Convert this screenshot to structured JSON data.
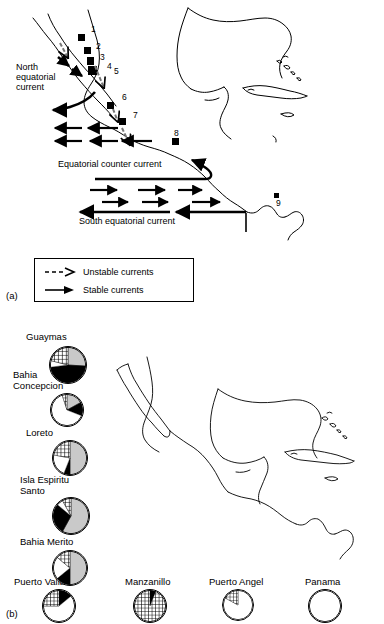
{
  "figure": {
    "panel_a_label": "(a)",
    "panel_b_label": "(b)"
  },
  "panel_a": {
    "current_labels": [
      {
        "text": "North\nequatorial\ncurrent",
        "x": 16,
        "y": 62
      },
      {
        "text": "Equatorial counter current",
        "x": 58,
        "y": 159
      },
      {
        "text": "South equatorial current",
        "x": 79,
        "y": 216
      }
    ],
    "site_numbers": [
      "1",
      "2",
      "3",
      "4",
      "5",
      "6",
      "7",
      "8",
      "9"
    ],
    "legend": {
      "title": "",
      "items": [
        {
          "icon": "dashed-arrow-icon",
          "label": "Unstable currents"
        },
        {
          "icon": "solid-arrow-icon",
          "label": "Stable currents"
        }
      ]
    }
  },
  "panel_b": {
    "haplotype_legend": {
      "title": "HAPLOTYPES",
      "quadrants": [
        {
          "id": "04 – 13",
          "fill": "black",
          "position": "top-left"
        },
        {
          "id": "01",
          "fill": "gray",
          "position": "top-right"
        },
        {
          "id": "02",
          "fill": "black",
          "position": "bottom-right"
        },
        {
          "id": "03",
          "fill": "white",
          "position": "bottom-left"
        }
      ]
    },
    "sites": [
      {
        "name": "Guaymas",
        "label_x": 26,
        "label_y": 332,
        "pie_x": 49,
        "pie_y": 346,
        "pie_d": 38
      },
      {
        "name": "Bahia\nConcepcion",
        "label_x": 13,
        "label_y": 370,
        "pie_x": 50,
        "pie_y": 393,
        "pie_d": 34
      },
      {
        "name": "Loreto",
        "label_x": 26,
        "label_y": 428,
        "pie_x": 52,
        "pie_y": 440,
        "pie_d": 36
      },
      {
        "name": "Isla Espiritu\nSanto",
        "label_x": 20,
        "label_y": 475,
        "pie_x": 52,
        "pie_y": 497,
        "pie_d": 38
      },
      {
        "name": "Bahia Merito",
        "label_x": 20,
        "label_y": 537,
        "pie_x": 52,
        "pie_y": 550,
        "pie_d": 36
      },
      {
        "name": "Puerto Vallarta",
        "label_x": 14,
        "label_y": 577,
        "pie_x": 42,
        "pie_y": 589,
        "pie_d": 34
      },
      {
        "name": "Manzanillo",
        "label_x": 125,
        "label_y": 577,
        "pie_x": 133,
        "pie_y": 589,
        "pie_d": 34
      },
      {
        "name": "Puerto Angel",
        "label_x": 209,
        "label_y": 577,
        "pie_x": 222,
        "pie_y": 589,
        "pie_d": 32
      },
      {
        "name": "Panama",
        "label_x": 305,
        "label_y": 577,
        "pie_x": 308,
        "pie_y": 589,
        "pie_d": 34
      }
    ]
  },
  "chart_data": {
    "type": "pie",
    "legend_title": "HAPLOTYPES",
    "categories": [
      "01",
      "02",
      "03",
      "04 – 13"
    ],
    "category_fills": {
      "01": "gray",
      "02": "black",
      "03": "white",
      "04 – 13": "crosshatch"
    },
    "legend_position": "top-right",
    "grid": false,
    "ylabel": "",
    "xlabel": "",
    "series": [
      {
        "name": "Guaymas",
        "values": [
          0.26,
          0.47,
          0.06,
          0.21
        ]
      },
      {
        "name": "Bahia Concepcion",
        "values": [
          0.17,
          0.14,
          0.64,
          0.05
        ]
      },
      {
        "name": "Loreto",
        "values": [
          0.5,
          0.06,
          0.22,
          0.22
        ]
      },
      {
        "name": "Isla Espiritu Santo",
        "values": [
          0.58,
          0.28,
          0.06,
          0.08
        ]
      },
      {
        "name": "Bahia Merito",
        "values": [
          0.5,
          0.14,
          0.22,
          0.14
        ]
      },
      {
        "name": "Puerto Vallarta",
        "values": [
          0.0,
          0.14,
          0.61,
          0.25
        ]
      },
      {
        "name": "Manzanillo",
        "values": [
          0.0,
          0.06,
          0.0,
          0.94
        ]
      },
      {
        "name": "Puerto Angel",
        "values": [
          0.0,
          0.0,
          0.83,
          0.17
        ]
      },
      {
        "name": "Panama",
        "values": [
          0.0,
          0.0,
          1.0,
          0.0
        ]
      }
    ]
  }
}
